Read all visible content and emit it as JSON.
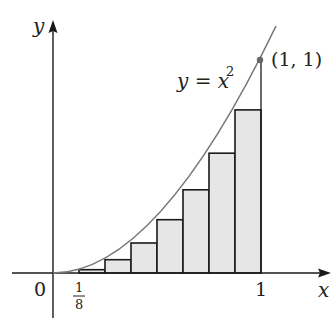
{
  "figure": {
    "curve_label": "y = x",
    "curve_exponent": "2",
    "point_label": "(1, 1)",
    "x_axis_label": "x",
    "y_axis_label": "y",
    "origin_label": "0",
    "tick_one_label": "1",
    "fraction_numerator": "1",
    "fraction_denominator": "8",
    "colors": {
      "axis": "#1a1a1a",
      "curve": "#777777",
      "rect_fill": "#e6e6e6",
      "rect_stroke": "#1a1a1a",
      "point": "#666666"
    },
    "n_rectangles": 8,
    "interval": [
      0,
      1
    ],
    "rectangle_heights": [
      0,
      0.015625,
      0.0625,
      0.140625,
      0.25,
      0.390625,
      0.5625,
      0.765625
    ]
  }
}
